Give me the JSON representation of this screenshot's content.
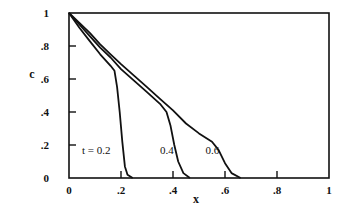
{
  "chart_data": {
    "type": "line",
    "title": "",
    "xlabel": "x",
    "ylabel": "c",
    "xlim": [
      0,
      1
    ],
    "ylim": [
      0,
      1
    ],
    "grid": false,
    "legend": "inline curve labels",
    "x_ticks": [
      {
        "value": 0,
        "label": "0"
      },
      {
        "value": 0.2,
        "label": ".2"
      },
      {
        "value": 0.4,
        "label": ".4"
      },
      {
        "value": 0.6,
        "label": ".6"
      },
      {
        "value": 0.8,
        "label": ".8"
      },
      {
        "value": 1,
        "label": "1"
      }
    ],
    "y_ticks": [
      {
        "value": 0,
        "label": "0"
      },
      {
        "value": 0.2,
        "label": ".2"
      },
      {
        "value": 0.4,
        "label": ".4"
      },
      {
        "value": 0.6,
        "label": ".6"
      },
      {
        "value": 0.8,
        "label": ".8"
      },
      {
        "value": 1,
        "label": "1"
      }
    ],
    "series": [
      {
        "name": "t = 0.2",
        "label": "t = 0.2",
        "label_pos": [
          0.05,
          0.17
        ],
        "points": [
          [
            0,
            1
          ],
          [
            0.04,
            0.91
          ],
          [
            0.08,
            0.83
          ],
          [
            0.12,
            0.75
          ],
          [
            0.16,
            0.68
          ],
          [
            0.175,
            0.65
          ],
          [
            0.185,
            0.55
          ],
          [
            0.195,
            0.4
          ],
          [
            0.205,
            0.22
          ],
          [
            0.215,
            0.07
          ],
          [
            0.225,
            0.02
          ],
          [
            0.245,
            0
          ]
        ]
      },
      {
        "name": "t = 0.4",
        "label": "0.4",
        "label_pos": [
          0.35,
          0.17
        ],
        "points": [
          [
            0,
            1
          ],
          [
            0.04,
            0.93
          ],
          [
            0.08,
            0.86
          ],
          [
            0.12,
            0.79
          ],
          [
            0.16,
            0.73
          ],
          [
            0.2,
            0.66
          ],
          [
            0.25,
            0.59
          ],
          [
            0.3,
            0.52
          ],
          [
            0.35,
            0.45
          ],
          [
            0.375,
            0.4
          ],
          [
            0.39,
            0.32
          ],
          [
            0.405,
            0.2
          ],
          [
            0.42,
            0.1
          ],
          [
            0.44,
            0.03
          ],
          [
            0.465,
            0
          ]
        ]
      },
      {
        "name": "t = 0.6",
        "label": "0.6",
        "label_pos": [
          0.525,
          0.17
        ],
        "points": [
          [
            0,
            1
          ],
          [
            0.04,
            0.94
          ],
          [
            0.08,
            0.88
          ],
          [
            0.12,
            0.81
          ],
          [
            0.16,
            0.75
          ],
          [
            0.2,
            0.69
          ],
          [
            0.25,
            0.62
          ],
          [
            0.3,
            0.55
          ],
          [
            0.35,
            0.48
          ],
          [
            0.4,
            0.41
          ],
          [
            0.45,
            0.33
          ],
          [
            0.5,
            0.27
          ],
          [
            0.55,
            0.22
          ],
          [
            0.575,
            0.17
          ],
          [
            0.6,
            0.09
          ],
          [
            0.625,
            0.03
          ],
          [
            0.66,
            0
          ]
        ]
      }
    ]
  }
}
